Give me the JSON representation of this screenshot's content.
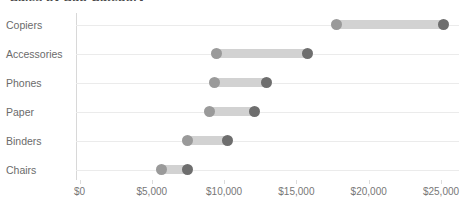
{
  "chart_data": {
    "type": "bar",
    "subtype": "dumbbell-range",
    "title": "Sales by Sub-Category",
    "xlabel": "",
    "ylabel": "",
    "xlim": [
      0,
      26000
    ],
    "grid": true,
    "legend": false,
    "axis_tick_labels": [
      "$0",
      "$5,000",
      "$10,000",
      "$15,000",
      "$20,000",
      "$25,000"
    ],
    "axis_tick_values": [
      0,
      5000,
      10000,
      15000,
      20000,
      25000
    ],
    "categories": [
      "Copiers",
      "Accessories",
      "Phones",
      "Paper",
      "Binders",
      "Chairs"
    ],
    "series": [
      {
        "name": "Low value",
        "values": [
          17800,
          9500,
          9350,
          9000,
          7500,
          5650
        ]
      },
      {
        "name": "High value",
        "values": [
          25200,
          15750,
          12950,
          12100,
          10250,
          7450
        ]
      }
    ],
    "rows": [
      {
        "category": "Copiers",
        "low": 17800,
        "high": 25200
      },
      {
        "category": "Accessories",
        "low": 9500,
        "high": 15750
      },
      {
        "category": "Phones",
        "low": 9350,
        "high": 12950
      },
      {
        "category": "Paper",
        "low": 9000,
        "high": 12100
      },
      {
        "category": "Binders",
        "low": 7500,
        "high": 10250
      },
      {
        "category": "Chairs",
        "low": 5650,
        "high": 7450
      }
    ],
    "colors": {
      "bar": "#d2d2d2",
      "dot_low": "#9a9a9a",
      "dot_high": "#6e6e6e",
      "gridline": "#ebebeb",
      "axis": "#d8d8d8",
      "text": "#6b6b6b"
    }
  }
}
